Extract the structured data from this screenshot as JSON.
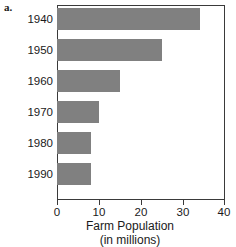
{
  "figure": {
    "part_label": "a."
  },
  "chart_data": {
    "type": "bar",
    "orientation": "horizontal",
    "title": "",
    "xlabel": "Farm Population",
    "xlabel_sub": "(in millions)",
    "ylabel": "",
    "categories": [
      "1940",
      "1950",
      "1960",
      "1970",
      "1980",
      "1990"
    ],
    "values": [
      34,
      25,
      15,
      10,
      8,
      8
    ],
    "xlim": [
      0,
      40
    ],
    "xticks": [
      0,
      10,
      20,
      30,
      40
    ],
    "xtick_labels": [
      "0",
      "10",
      "20",
      "30",
      "40"
    ],
    "grid": false,
    "legend": null,
    "bar_color": "#808080",
    "frame_color": "#3a3a3a"
  }
}
